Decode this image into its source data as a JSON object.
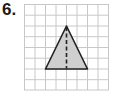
{
  "problem": {
    "number_label": "6."
  },
  "grid": {
    "columns": 8,
    "rows": 8,
    "line_color": "#c8c8c8"
  },
  "triangle": {
    "fill_color": "#cfcfcf",
    "stroke_color": "#222222",
    "vertices_grid": [
      [
        4,
        2
      ],
      [
        2,
        6
      ],
      [
        6,
        6
      ]
    ],
    "height_line": "dashed, from apex (4,2) to base midpoint (4,6)"
  }
}
